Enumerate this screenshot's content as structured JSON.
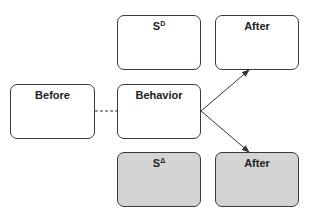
{
  "diagram": {
    "type": "three-term contingency",
    "colors": {
      "border": "#3a3a3a",
      "fill_plain": "#ffffff",
      "fill_shaded": "#d4d4d4",
      "text": "#222222",
      "line": "#333333"
    },
    "nodes": [
      {
        "id": "before",
        "label": "Before",
        "base": "",
        "sup": "",
        "shaded": false,
        "x": 10,
        "y": 84,
        "w": 85,
        "h": 55
      },
      {
        "id": "behavior",
        "label": "Behavior",
        "base": "",
        "sup": "",
        "shaded": false,
        "x": 117,
        "y": 84,
        "w": 84,
        "h": 55
      },
      {
        "id": "s-d",
        "label": "",
        "base": "S",
        "sup": "D",
        "shaded": false,
        "x": 117,
        "y": 15,
        "w": 84,
        "h": 55
      },
      {
        "id": "after-top",
        "label": "After",
        "base": "",
        "sup": "",
        "shaded": false,
        "x": 215,
        "y": 15,
        "w": 84,
        "h": 55
      },
      {
        "id": "s-delta",
        "label": "",
        "base": "S",
        "sup": "Δ",
        "shaded": true,
        "x": 117,
        "y": 152,
        "w": 84,
        "h": 55
      },
      {
        "id": "after-bottom",
        "label": "After",
        "base": "",
        "sup": "",
        "shaded": true,
        "x": 215,
        "y": 152,
        "w": 84,
        "h": 55
      }
    ],
    "edges": [
      {
        "from": "before",
        "to": "behavior",
        "style": "dashed",
        "arrow": false
      },
      {
        "from": "behavior",
        "to": "after-top",
        "style": "solid",
        "arrow": true
      },
      {
        "from": "behavior",
        "to": "after-bottom",
        "style": "solid",
        "arrow": true
      }
    ]
  }
}
